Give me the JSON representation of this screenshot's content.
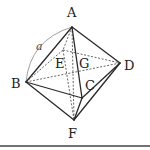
{
  "figure": {
    "vertices": [
      "A",
      "B",
      "C",
      "D",
      "E",
      "F"
    ],
    "center_label": "G",
    "edge_length_label": "a",
    "visible_edges": [
      [
        "A",
        "B"
      ],
      [
        "A",
        "C"
      ],
      [
        "A",
        "D"
      ],
      [
        "B",
        "C"
      ],
      [
        "C",
        "D"
      ],
      [
        "B",
        "F"
      ],
      [
        "C",
        "F"
      ],
      [
        "D",
        "F"
      ]
    ],
    "hidden_edges": [
      [
        "A",
        "E"
      ],
      [
        "B",
        "E"
      ],
      [
        "E",
        "D"
      ],
      [
        "E",
        "F"
      ],
      [
        "B",
        "D"
      ],
      [
        "A",
        "F"
      ]
    ],
    "labels": {
      "A": "A",
      "B": "B",
      "C": "C",
      "D": "D",
      "E": "E",
      "F": "F",
      "G": "G",
      "a": "a"
    }
  }
}
